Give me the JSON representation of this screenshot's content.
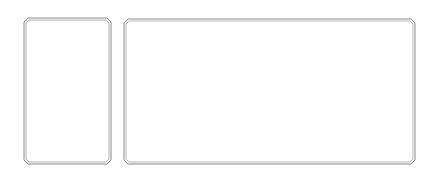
{
  "diagram": {
    "background": "#ffffff",
    "stroke_color": "#8a8a8a",
    "panels": [
      {
        "id": "left-panel",
        "x": 24,
        "y": 18,
        "width": 87,
        "height": 146,
        "label": ""
      },
      {
        "id": "right-panel",
        "x": 124,
        "y": 19,
        "width": 291,
        "height": 145,
        "label": ""
      }
    ]
  }
}
